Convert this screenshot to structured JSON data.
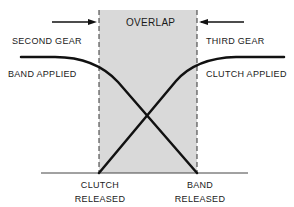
{
  "diagram": {
    "overlap_label": "OVERLAP",
    "left_state": {
      "gear": "SECOND GEAR",
      "element": "BAND APPLIED"
    },
    "right_state": {
      "gear": "THIRD GEAR",
      "element": "CLUTCH APPLIED"
    },
    "bottom_labels": {
      "clutch": [
        "CLUTCH",
        "RELEASED"
      ],
      "band": [
        "BAND",
        "RELEASED"
      ]
    },
    "curves": [
      {
        "name": "band",
        "description": "Applied on left, falls through overlap to released at right edge"
      },
      {
        "name": "clutch",
        "description": "Released at left edge of overlap, rises to applied on right"
      }
    ],
    "colors": {
      "overlap_fill": "#d9d9d9",
      "line": "#111111",
      "background": "#ffffff"
    }
  }
}
